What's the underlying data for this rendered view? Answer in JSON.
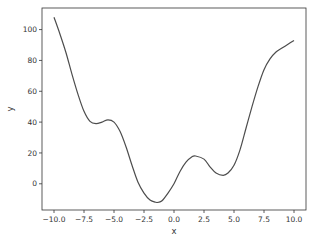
{
  "chart_data": {
    "type": "line",
    "title": "",
    "xlabel": "x",
    "ylabel": "y",
    "xlim": [
      -11,
      11
    ],
    "ylim": [
      -17,
      114
    ],
    "grid": false,
    "legend": null,
    "x_ticks": [
      -10.0,
      -7.5,
      -5.0,
      -2.5,
      0.0,
      2.5,
      5.0,
      7.5,
      10.0
    ],
    "x_tick_labels": [
      "−10.0",
      "−7.5",
      "−5.0",
      "−2.5",
      "0.0",
      "2.5",
      "5.0",
      "7.5",
      "10.0"
    ],
    "y_ticks": [
      0,
      20,
      40,
      60,
      80,
      100
    ],
    "y_tick_labels": [
      "0",
      "20",
      "40",
      "60",
      "80",
      "100"
    ],
    "series": [
      {
        "name": "y",
        "color": "#4d4d4d",
        "x": [
          -10,
          -9.5,
          -9,
          -8.5,
          -8,
          -7.5,
          -7,
          -6.5,
          -6,
          -5.5,
          -5,
          -4.5,
          -4,
          -3.5,
          -3,
          -2.5,
          -2,
          -1.5,
          -1.3,
          -1,
          -0.5,
          0,
          0.5,
          1,
          1.5,
          1.8,
          2.5,
          3,
          3.5,
          4.1,
          4.5,
          5,
          5.5,
          6,
          6.5,
          7,
          7.5,
          8,
          8.5,
          9,
          9.5,
          10
        ],
        "y": [
          108,
          97,
          85,
          71,
          58,
          47,
          40.5,
          39,
          40,
          41.5,
          40,
          34,
          24,
          12,
          1,
          -6,
          -10.5,
          -12,
          -12,
          -11,
          -6,
          0,
          8,
          14,
          17.5,
          18,
          16,
          11,
          7,
          5.5,
          7,
          12,
          22,
          36,
          50,
          63,
          74,
          81,
          85.5,
          88,
          90.5,
          93
        ]
      }
    ]
  }
}
